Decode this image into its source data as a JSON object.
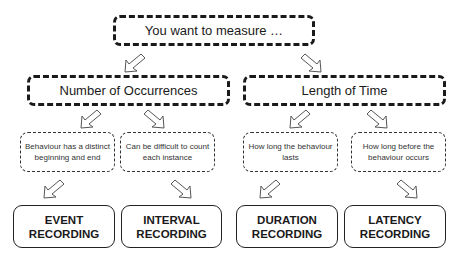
{
  "root": {
    "label": "You want to measure …"
  },
  "categories": [
    {
      "label": "Number of Occurrences"
    },
    {
      "label": "Length of Time"
    }
  ],
  "descriptions": [
    {
      "label": "Behaviour has a distinct beginning and end"
    },
    {
      "label": "Can be difficult to count each instance"
    },
    {
      "label": "How long the behaviour lasts"
    },
    {
      "label": "How long before the behaviour occurs"
    }
  ],
  "methods": [
    {
      "line1": "EVENT",
      "line2": "RECORDING"
    },
    {
      "line1": "INTERVAL",
      "line2": "RECORDING"
    },
    {
      "line1": "DURATION",
      "line2": "RECORDING"
    },
    {
      "line1": "LATENCY",
      "line2": "RECORDING"
    }
  ],
  "arrows": {
    "icon_down_left": "arrow-down-left-icon",
    "icon_down_right": "arrow-down-right-icon"
  }
}
